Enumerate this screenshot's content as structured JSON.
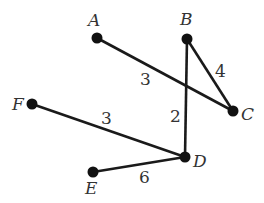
{
  "caption": "(B)",
  "nodes": [
    {
      "id": "A",
      "x": 97,
      "y": 38,
      "lx": 88,
      "ly": 26
    },
    {
      "id": "B",
      "x": 187,
      "y": 39,
      "lx": 180,
      "ly": 25
    },
    {
      "id": "C",
      "x": 233,
      "y": 111,
      "lx": 241,
      "ly": 120
    },
    {
      "id": "D",
      "x": 185,
      "y": 157,
      "lx": 193,
      "ly": 167
    },
    {
      "id": "E",
      "x": 93,
      "y": 172,
      "lx": 85,
      "ly": 194
    },
    {
      "id": "F",
      "x": 32,
      "y": 104,
      "lx": 12,
      "ly": 110
    }
  ],
  "edges": [
    {
      "from": "A",
      "to": "C",
      "weight": "3",
      "wx": 140,
      "wy": 85
    },
    {
      "from": "B",
      "to": "C",
      "weight": "4",
      "wx": 215,
      "wy": 77
    },
    {
      "from": "B",
      "to": "D",
      "weight": "2",
      "wx": 170,
      "wy": 122
    },
    {
      "from": "F",
      "to": "D",
      "weight": "3",
      "wx": 101,
      "wy": 124
    },
    {
      "from": "E",
      "to": "D",
      "weight": "6",
      "wx": 139,
      "wy": 183
    }
  ]
}
